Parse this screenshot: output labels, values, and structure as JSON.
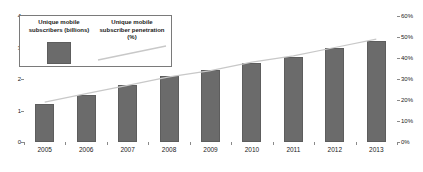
{
  "chart_data": {
    "type": "bar",
    "title": "",
    "subtitle": "",
    "xlabel": "",
    "ylabel": "",
    "grid": false,
    "legend_position": "top-left",
    "categories": [
      "2005",
      "2006",
      "2007",
      "2008",
      "2009",
      "2010",
      "2011",
      "2012",
      "2013"
    ],
    "series": [
      {
        "name": "Unique mobile subscribers (billions)",
        "type": "bar",
        "axis": "left",
        "color": "#6b6b6b",
        "values": [
          1.2,
          1.5,
          1.8,
          2.1,
          2.3,
          2.5,
          2.7,
          3.0,
          3.2
        ]
      },
      {
        "name": "Unique mobile subscriber penetration (%)",
        "type": "line",
        "axis": "right",
        "color": "#c8c8c8",
        "values": [
          19,
          23,
          27,
          31,
          34,
          38,
          41,
          45,
          49
        ]
      }
    ],
    "left_axis": {
      "ticks": [
        "0",
        "1",
        "2",
        "3",
        "4"
      ],
      "ylim": [
        0,
        4
      ]
    },
    "right_axis": {
      "ticks": [
        "0%",
        "10%",
        "20%",
        "30%",
        "40%",
        "50%",
        "60%"
      ],
      "ylim": [
        0,
        60
      ]
    }
  },
  "legend": {
    "entries": [
      {
        "label": "Unique mobile subscribers (billions)",
        "swatch": "bar-swatch"
      },
      {
        "label": "Unique mobile subscriber penetration (%)",
        "swatch": "line-swatch"
      }
    ]
  },
  "axes": {
    "left_labels": [
      "4",
      "3",
      "2",
      "1",
      "0"
    ],
    "right_labels": [
      "60%",
      "50%",
      "40%",
      "30%",
      "20%",
      "10%",
      "0%"
    ],
    "x_labels": [
      "2005",
      "2006",
      "2007",
      "2008",
      "2009",
      "2010",
      "2011",
      "2012",
      "2013"
    ]
  }
}
